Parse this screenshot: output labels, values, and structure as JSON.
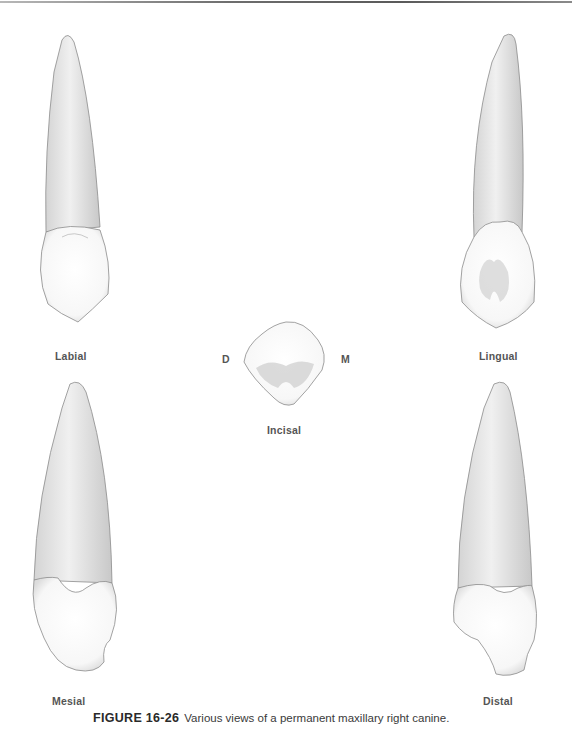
{
  "figure": {
    "number": "FIGURE 16-26",
    "caption": "Various views of a permanent maxillary right canine."
  },
  "views": {
    "labial": "Labial",
    "lingual": "Lingual",
    "mesial": "Mesial",
    "distal": "Distal",
    "incisal": "Incisal"
  },
  "orientation": {
    "distal_marker": "D",
    "mesial_marker": "M"
  },
  "colors": {
    "root": "#e6e6e6",
    "crown": "#fbfbfb",
    "outline": "#8c8c8c",
    "label": "#555555"
  }
}
